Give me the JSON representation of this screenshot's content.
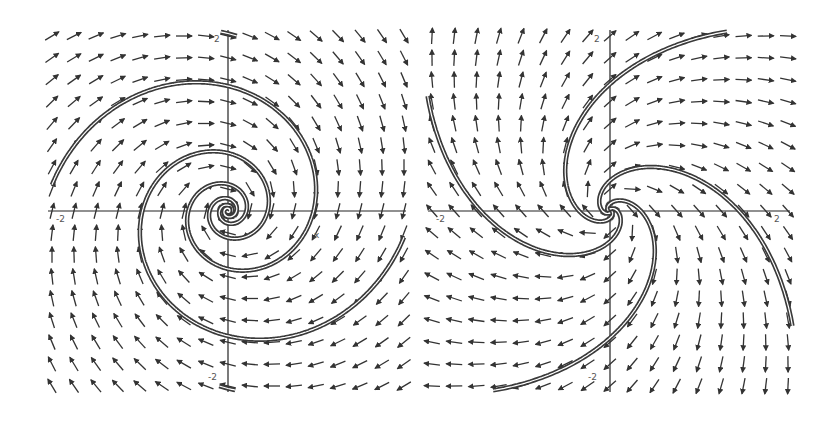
{
  "chart_data": [
    {
      "type": "vector_field",
      "title": "",
      "xlabel": "x",
      "ylabel": "y",
      "xlim": [
        -2,
        2
      ],
      "ylim": [
        -2,
        2
      ],
      "grid": false,
      "field": {
        "a": -0.25,
        "description": "dx/dt = a*x + y, dy/dt = -x + a*y (clockwise spiral sink)"
      },
      "arrow_grid": {
        "nx": 17,
        "ny": 17
      },
      "tick_labels": {
        "x_left": "-2",
        "x_right": "2",
        "y_top": "2",
        "y_bottom": "-2"
      },
      "trajectories": [
        {
          "start": [
            -2.0,
            0.3
          ],
          "dir": 1
        },
        {
          "start": [
            2.0,
            -0.3
          ],
          "dir": 1
        },
        {
          "start": [
            -0.1,
            -2.0
          ],
          "dir": -1
        },
        {
          "start": [
            0.1,
            2.0
          ],
          "dir": -1
        }
      ]
    },
    {
      "type": "vector_field",
      "title": "",
      "xlabel": "x",
      "ylabel": "y",
      "xlim": [
        -2,
        2
      ],
      "ylim": [
        -2,
        2
      ],
      "grid": false,
      "field": {
        "a": 0.9,
        "description": "dx/dt = a*x + y, dy/dt = -x + a*y (clockwise spiral source)"
      },
      "arrow_grid": {
        "nx": 17,
        "ny": 17
      },
      "tick_labels": {
        "x_left": "-2",
        "x_right": "2",
        "y_top": "2",
        "y_bottom": "-2"
      },
      "trajectories": [
        {
          "start": [
            0.02,
            0.0
          ],
          "dir": 1
        },
        {
          "start": [
            -0.02,
            0.0
          ],
          "dir": 1
        },
        {
          "start": [
            0.0,
            0.02
          ],
          "dir": 1
        },
        {
          "start": [
            0.0,
            -0.02
          ],
          "dir": 1
        }
      ]
    }
  ],
  "panels": [
    {
      "box": [
        52,
        36,
        404,
        386
      ],
      "axis_color": "#222222",
      "arrow_color": "#333333",
      "curve_color": "#3a3a3a"
    },
    {
      "box": [
        432,
        36,
        788,
        386
      ],
      "axis_color": "#222222",
      "arrow_color": "#333333",
      "curve_color": "#3a3a3a"
    }
  ]
}
